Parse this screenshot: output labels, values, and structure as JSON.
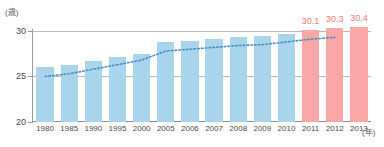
{
  "chart_data": {
    "type": "bar",
    "title": "",
    "subtitle": "",
    "xlabel": "(年)",
    "ylabel": "(歳)",
    "ylim": [
      20,
      30
    ],
    "yticks": [
      20,
      25,
      30
    ],
    "ytick_labels": [
      "20",
      "25",
      "30"
    ],
    "grid": true,
    "legend": "none",
    "categories": [
      "1980",
      "1985",
      "1990",
      "1995",
      "2000",
      "2005",
      "2006",
      "2007",
      "2008",
      "2009",
      "2010",
      "2011",
      "2012",
      "2013"
    ],
    "values": [
      26.1,
      26.3,
      26.7,
      27.1,
      27.5,
      28.8,
      28.9,
      29.1,
      29.3,
      29.4,
      29.7,
      30.1,
      30.3,
      30.4
    ],
    "bar_colors": [
      "blue",
      "blue",
      "blue",
      "blue",
      "blue",
      "blue",
      "blue",
      "blue",
      "blue",
      "blue",
      "blue",
      "red",
      "red",
      "red"
    ],
    "data_labels": [
      "",
      "",
      "",
      "",
      "",
      "",
      "",
      "",
      "",
      "",
      "",
      "30.1",
      "30.3",
      "30.4"
    ],
    "series": [
      {
        "name": "bars",
        "values": [
          26.1,
          26.3,
          26.7,
          27.1,
          27.5,
          28.8,
          28.9,
          29.1,
          29.3,
          29.4,
          29.7,
          30.1,
          30.3,
          30.4
        ]
      },
      {
        "name": "trend-dotted",
        "style": "dotted",
        "values": [
          25.0,
          25.3,
          25.8,
          26.3,
          26.8,
          27.8,
          28.0,
          28.2,
          28.4,
          28.5,
          28.8,
          29.1,
          29.3,
          null
        ]
      }
    ],
    "colors": {
      "bar_blue": "#a9d5ec",
      "bar_red": "#f9a7a7",
      "label_red": "#f07a7a",
      "trend_line": "#4e8fbe",
      "gridline": "#b9b9b9",
      "axis": "#9a9a9a",
      "tick_text": "#4a4a4a"
    }
  }
}
